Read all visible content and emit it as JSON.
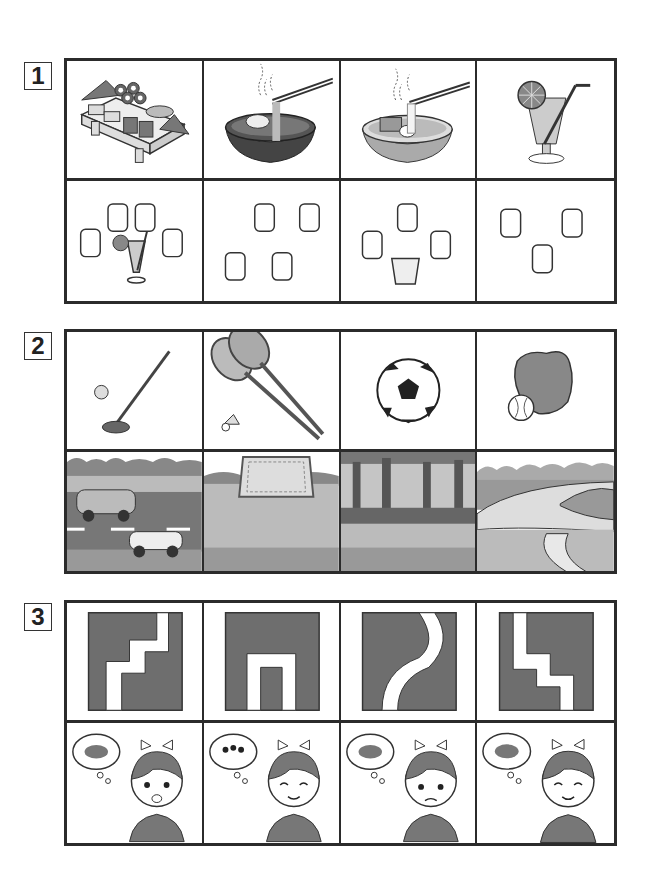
{
  "questions": [
    {
      "number": "1",
      "top_row": [
        {
          "label": "sushi platter"
        },
        {
          "label": "tempura soba bowl"
        },
        {
          "label": "udon noodle bowl"
        },
        {
          "label": "juice with lemon slice and straw"
        }
      ],
      "bottom_row": [
        {
          "label": "4 hot teacups and 1 juice"
        },
        {
          "label": "4 hot teacups"
        },
        {
          "label": "3 hot teacups and 1 glass of water"
        },
        {
          "label": "3 hot teacups"
        }
      ]
    },
    {
      "number": "2",
      "top_row": [
        {
          "label": "golf club and ball"
        },
        {
          "label": "badminton rackets and shuttlecock"
        },
        {
          "label": "soccer ball"
        },
        {
          "label": "baseball glove and ball"
        }
      ],
      "bottom_row": [
        {
          "label": "road with cars"
        },
        {
          "label": "grass field with goal net"
        },
        {
          "label": "forest"
        },
        {
          "label": "running track"
        }
      ]
    },
    {
      "number": "3",
      "top_row": [
        {
          "label": "staircase path pattern"
        },
        {
          "label": "arch path pattern"
        },
        {
          "label": "curved path pattern"
        },
        {
          "label": "reversed staircase path pattern"
        }
      ],
      "bottom_row": [
        {
          "label": "girl surprised, thinking of pill bug"
        },
        {
          "label": "girl smiling, thinking of ant"
        },
        {
          "label": "girl worried, thinking of pill bug"
        },
        {
          "label": "girl smiling, thinking of pill bug"
        }
      ]
    }
  ],
  "colors": {
    "border": "#2b2b2b",
    "dark_fill": "#6e6e6e",
    "mid_fill": "#9a9a9a",
    "light_fill": "#c4c4c4"
  }
}
